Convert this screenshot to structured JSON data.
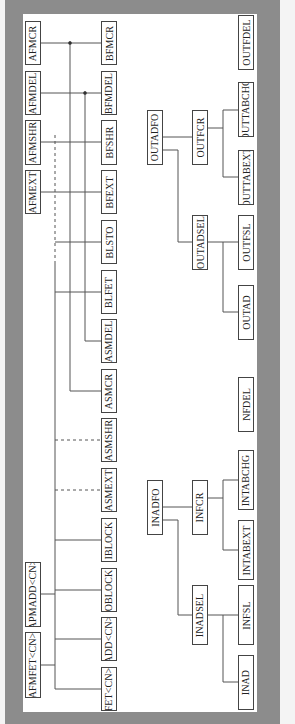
{
  "diagram": {
    "type": "hierarchy",
    "orientation": "rotated-90-ccw",
    "left_group": {
      "top_nodes": [
        {
          "id": "AFMCR",
          "label": "AFMCR",
          "box": [
            25,
            21,
            16,
            44
          ]
        },
        {
          "id": "AFMDEL",
          "label": "AFMDEL",
          "box": [
            25,
            71,
            16,
            44
          ]
        },
        {
          "id": "AFMSHR",
          "label": "AFMSHR",
          "box": [
            25,
            120,
            16,
            45
          ]
        },
        {
          "id": "AFMEXT",
          "label": "AFMEXT",
          "box": [
            25,
            170,
            16,
            44
          ]
        },
        {
          "id": "APMADD",
          "label": "APMADD<CN>",
          "box": [
            25,
            562,
            16,
            65
          ]
        },
        {
          "id": "AFMFET",
          "label": "AFMFET<CN>",
          "box": [
            25,
            632,
            16,
            66
          ]
        }
      ],
      "bottom_nodes": [
        {
          "id": "BFMCR",
          "label": "BFMCR",
          "box": [
            101,
            21,
            16,
            44
          ]
        },
        {
          "id": "BFMDEL",
          "label": "BFMDEL",
          "box": [
            101,
            71,
            16,
            44
          ]
        },
        {
          "id": "BFSHR",
          "label": "BFSHR",
          "box": [
            101,
            120,
            16,
            45
          ]
        },
        {
          "id": "BFEXT",
          "label": "BFEXT",
          "box": [
            101,
            170,
            16,
            44
          ]
        },
        {
          "id": "BLSTO",
          "label": "BLSTO",
          "box": [
            101,
            220,
            16,
            44
          ]
        },
        {
          "id": "BLFET",
          "label": "BLFET",
          "box": [
            101,
            270,
            16,
            44
          ]
        },
        {
          "id": "ASMDEL",
          "label": "ASMDEL",
          "box": [
            101,
            319,
            16,
            44
          ]
        },
        {
          "id": "ASMCR",
          "label": "ASMCR",
          "box": [
            101,
            369,
            16,
            44
          ]
        },
        {
          "id": "ASMSHR",
          "label": "ASMSHR",
          "box": [
            101,
            418,
            16,
            44
          ]
        },
        {
          "id": "ASMEXT",
          "label": "ASMEXT",
          "box": [
            101,
            468,
            16,
            44
          ]
        },
        {
          "id": "IBLOCK",
          "label": "IBLOCK",
          "box": [
            101,
            518,
            16,
            44
          ]
        },
        {
          "id": "OBLOCK",
          "label": "OBLOCK",
          "box": [
            101,
            568,
            16,
            44
          ]
        },
        {
          "id": "ADD",
          "label": "ADD<CN>",
          "box": [
            101,
            617,
            16,
            44
          ]
        },
        {
          "id": "FET",
          "label": "FET<CN>",
          "box": [
            101,
            667,
            16,
            44
          ]
        }
      ]
    },
    "out_tree": [
      {
        "id": "OUTADFO",
        "label": "OUTADFO",
        "box": [
          147,
          110,
          16,
          55
        ]
      },
      {
        "id": "OUTFCR",
        "label": "OUTFCR",
        "box": [
          192,
          110,
          16,
          55
        ]
      },
      {
        "id": "OUTTABCHG",
        "label": "OUTTABCHG",
        "box": [
          238,
          82,
          16,
          55
        ]
      },
      {
        "id": "OUTTABEXT",
        "label": "OUTTABEXT",
        "box": [
          238,
          150,
          16,
          55
        ]
      },
      {
        "id": "OUTADSEL",
        "label": "OUTADSEL",
        "box": [
          192,
          215,
          16,
          55
        ]
      },
      {
        "id": "OUTFSL",
        "label": "OUTFSL",
        "box": [
          238,
          215,
          16,
          55
        ]
      },
      {
        "id": "OUTAD",
        "label": "OUTAD",
        "box": [
          238,
          285,
          16,
          55
        ]
      }
    ],
    "standalone": [
      {
        "id": "OUTFDEL",
        "label": "OUTFDEL",
        "box": [
          238,
          15,
          16,
          55
        ]
      },
      {
        "id": "NFDEL",
        "label": "NFDEL",
        "box": [
          238,
          377,
          16,
          55
        ]
      }
    ],
    "in_tree": [
      {
        "id": "INADFO",
        "label": "INADFO",
        "box": [
          147,
          480,
          16,
          55
        ]
      },
      {
        "id": "INFCR",
        "label": "INFCR",
        "box": [
          192,
          480,
          16,
          55
        ]
      },
      {
        "id": "INTABCHG",
        "label": "INTABCHG",
        "box": [
          238,
          450,
          16,
          60
        ]
      },
      {
        "id": "INTABEXT",
        "label": "INTABEXT",
        "box": [
          238,
          520,
          16,
          60
        ]
      },
      {
        "id": "INADSEL",
        "label": "INADSEL",
        "box": [
          192,
          585,
          16,
          60
        ]
      },
      {
        "id": "INFSL",
        "label": "INFSL",
        "box": [
          238,
          585,
          16,
          60
        ]
      },
      {
        "id": "INAD",
        "label": "INAD",
        "box": [
          238,
          655,
          16,
          55
        ]
      }
    ],
    "colors": {
      "frame": "#8c8c8c",
      "panel": "#ffffff",
      "line": "#555555",
      "box_border": "#444444"
    }
  }
}
